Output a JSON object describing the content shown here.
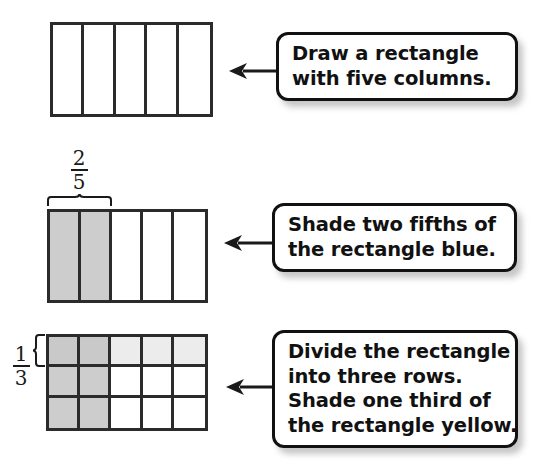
{
  "page": {
    "background_color": "#ffffff",
    "line_color": "#2b2b2b"
  },
  "palette": {
    "blue_shade": "#cdcdcd",
    "yellow_shade": "#ececec",
    "overlap_shade": "#c9c9c9",
    "unshaded": "#ffffff",
    "callout_border": "#111111",
    "callout_fill": "#ffffff"
  },
  "steps": [
    {
      "id": "step-one",
      "figure": {
        "name": "rectangle-five-columns",
        "columns": 5,
        "rows": 1,
        "cells": [
          [
            "none",
            "none",
            "none",
            "none",
            "none"
          ]
        ]
      },
      "fraction": null,
      "callout": {
        "lines": [
          "Draw a rectangle",
          "with five columns."
        ]
      }
    },
    {
      "id": "step-two",
      "figure": {
        "name": "rectangle-two-fifths-shaded",
        "columns": 5,
        "rows": 1,
        "cells": [
          [
            "blue",
            "blue",
            "none",
            "none",
            "none"
          ]
        ]
      },
      "fraction": {
        "name": "two-fifths",
        "numerator": "2",
        "denominator": "5",
        "brace": "top",
        "spans_columns": 2
      },
      "callout": {
        "lines": [
          "Shade two fifths of",
          "the rectangle blue."
        ]
      }
    },
    {
      "id": "step-three",
      "figure": {
        "name": "grid-three-rows-five-columns",
        "columns": 5,
        "rows": 3,
        "cells": [
          [
            "both",
            "both",
            "yellow",
            "yellow",
            "yellow"
          ],
          [
            "blue",
            "blue",
            "none",
            "none",
            "none"
          ],
          [
            "blue",
            "blue",
            "none",
            "none",
            "none"
          ]
        ]
      },
      "fraction": {
        "name": "one-third",
        "numerator": "1",
        "denominator": "3",
        "brace": "left",
        "spans_rows": 1
      },
      "callout": {
        "lines": [
          "Divide the rectangle",
          "into three rows.",
          "Shade one third of",
          "the rectangle yellow."
        ]
      }
    }
  ],
  "arrows": [
    {
      "name": "arrow-to-step-one",
      "direction": "left"
    },
    {
      "name": "arrow-to-step-two",
      "direction": "left"
    },
    {
      "name": "arrow-to-step-three",
      "direction": "left"
    }
  ]
}
